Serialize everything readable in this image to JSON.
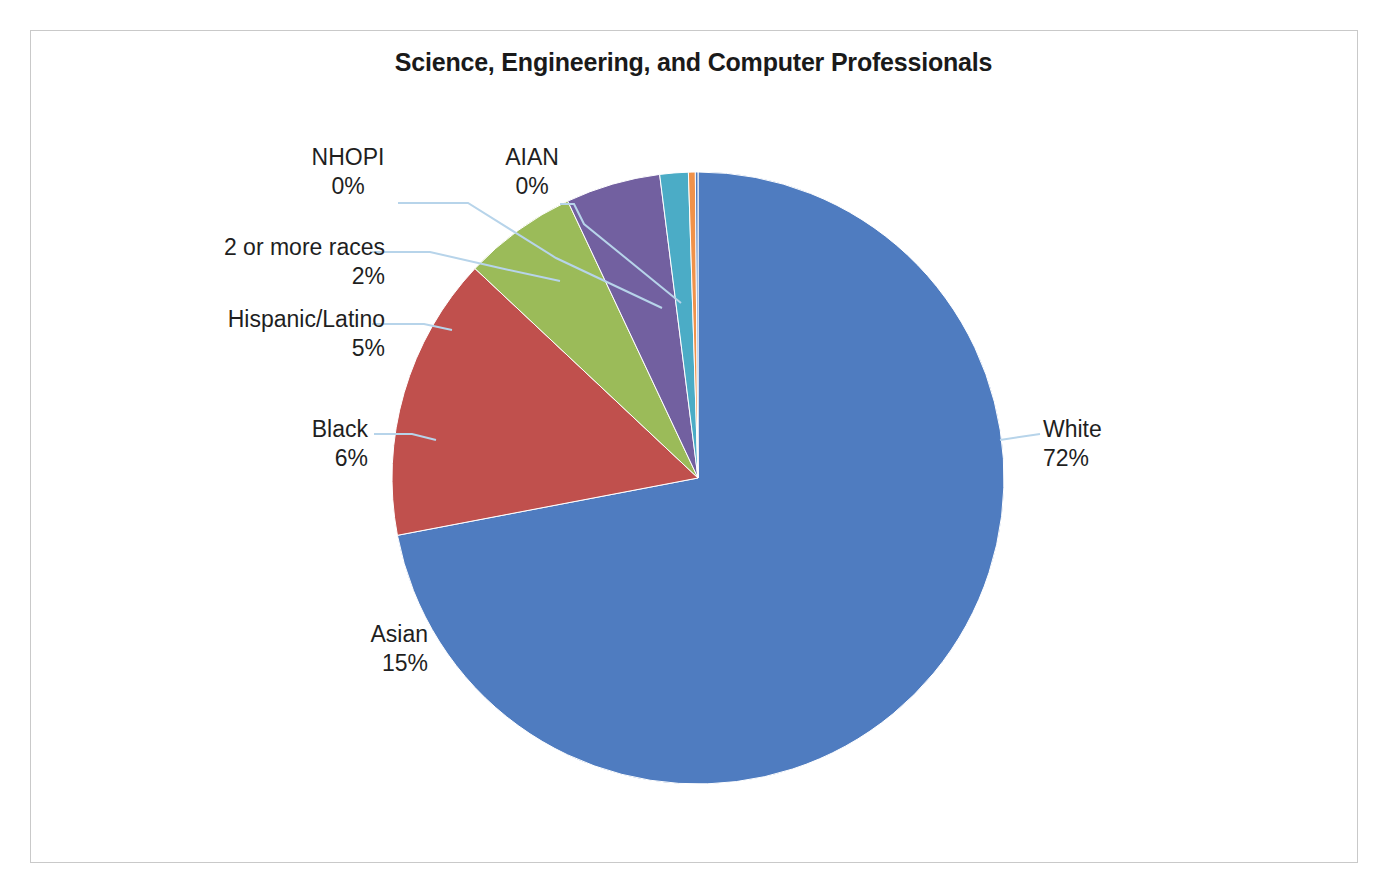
{
  "chart_data": {
    "type": "pie",
    "title": "Science, Engineering, and Computer Professionals",
    "subtitle": "",
    "xlabel": "",
    "ylabel": "",
    "legend_position": "none",
    "labels_position": "outside-with-leader-lines",
    "grid": false,
    "categories": [
      "White",
      "Asian",
      "Black",
      "Hispanic/Latino",
      "2 or more races",
      "NHOPI",
      "AIAN"
    ],
    "values": [
      72,
      15,
      6,
      5,
      2,
      0,
      0
    ],
    "value_unit": "percent",
    "start_angle_deg": 0,
    "direction": "clockwise",
    "slices": [
      {
        "label": "White",
        "value": 72,
        "value_text": "72%",
        "color": "#4f7cc0",
        "start_deg": 0.0,
        "sweep_deg": 259.2
      },
      {
        "label": "Asian",
        "value": 15,
        "value_text": "15%",
        "color": "#c0504d",
        "start_deg": 259.2,
        "sweep_deg": 54.0
      },
      {
        "label": "Black",
        "value": 6,
        "value_text": "6%",
        "color": "#9bbb59",
        "start_deg": 313.2,
        "sweep_deg": 21.6
      },
      {
        "label": "Hispanic/Latino",
        "value": 5,
        "value_text": "5%",
        "color": "#7260a0",
        "start_deg": 334.8,
        "sweep_deg": 18.0
      },
      {
        "label": "2 or more races",
        "value": 2,
        "value_text": "2%",
        "color": "#4bacc6",
        "start_deg": 352.8,
        "sweep_deg": 5.4
      },
      {
        "label": "NHOPI",
        "value": 0,
        "value_text": "0%",
        "color": "#f0924a",
        "start_deg": 358.2,
        "sweep_deg": 1.3
      },
      {
        "label": "AIAN",
        "value": 0,
        "value_text": "0%",
        "color": "#4f7cc0",
        "start_deg": 359.5,
        "sweep_deg": 0.5
      }
    ],
    "colors": {
      "white_slice": "#4f7cc0",
      "asian_slice": "#c0504d",
      "black_slice": "#9bbb59",
      "hispanic_slice": "#7260a0",
      "two_or_more_slice": "#4bacc6",
      "nhopi_slice": "#f0924a",
      "aian_slice": "#4f7cc0",
      "leader_line": "#b7d4ea",
      "chart_border": "#c9c9c9",
      "title_text": "#1a1a1a",
      "label_text": "#1f1f1f",
      "background": "#ffffff"
    },
    "geometry": {
      "center_x": 698,
      "center_y": 478,
      "radius": 306
    }
  },
  "chart": {
    "title": "Science, Engineering, and Computer Professionals"
  },
  "labels": {
    "white": {
      "name": "White",
      "value": "72%"
    },
    "asian": {
      "name": "Asian",
      "value": "15%"
    },
    "black": {
      "name": "Black",
      "value": "6%"
    },
    "hispanic": {
      "name": "Hispanic/Latino",
      "value": "5%"
    },
    "twomore": {
      "name": "2 or more races",
      "value": "2%"
    },
    "nhopi": {
      "name": "NHOPI",
      "value": "0%"
    },
    "aian": {
      "name": "AIAN",
      "value": "0%"
    }
  }
}
